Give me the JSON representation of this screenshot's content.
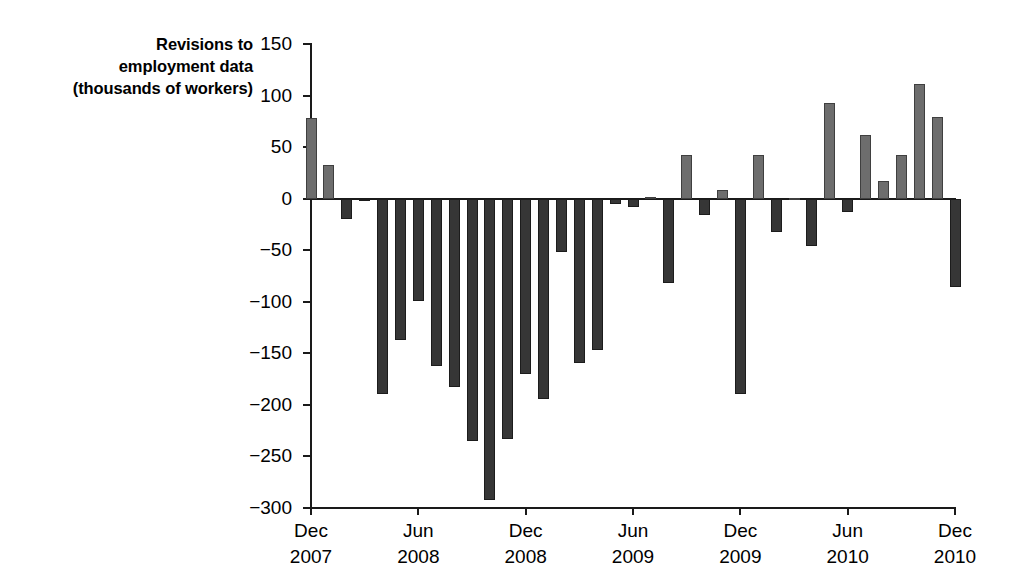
{
  "chart_data": {
    "type": "bar",
    "title": "",
    "ylabel_lines": [
      "Revisions to",
      "employment data",
      "(thousands of workers)"
    ],
    "xlabel": "",
    "ylabel": "Revisions to employment data (thousands of workers)",
    "ylim": [
      -300,
      150
    ],
    "ytick_values": [
      150,
      100,
      50,
      0,
      -50,
      -100,
      -150,
      -200,
      -250,
      -300
    ],
    "ytick_labels": [
      "150",
      "100",
      "50",
      "0",
      "−50",
      "−100",
      "−150",
      "−200",
      "−250",
      "−300"
    ],
    "grid": false,
    "legend": "none",
    "xtick_labels": [
      {
        "month": "Dec",
        "year": "2007",
        "index": 0
      },
      {
        "month": "Jun",
        "year": "2008",
        "index": 6
      },
      {
        "month": "Dec",
        "year": "2008",
        "index": 12
      },
      {
        "month": "Jun",
        "year": "2009",
        "index": 18
      },
      {
        "month": "Dec",
        "year": "2009",
        "index": 24
      },
      {
        "month": "Jun",
        "year": "2010",
        "index": 30
      },
      {
        "month": "Dec",
        "year": "2010",
        "index": 36
      }
    ],
    "categories": [
      "Dec 2007",
      "Jan 2008",
      "Feb 2008",
      "Mar 2008",
      "Apr 2008",
      "May 2008",
      "Jun 2008",
      "Jul 2008",
      "Aug 2008",
      "Sep 2008",
      "Oct 2008",
      "Nov 2008",
      "Dec 2008",
      "Jan 2009",
      "Feb 2009",
      "Mar 2009",
      "Apr 2009",
      "May 2009",
      "Jun 2009",
      "Jul 2009",
      "Aug 2009",
      "Sep 2009",
      "Oct 2009",
      "Nov 2009",
      "Dec 2009",
      "Jan 2010",
      "Feb 2010",
      "Mar 2010",
      "Apr 2010",
      "May 2010",
      "Jun 2010",
      "Jul 2010",
      "Aug 2010",
      "Sep 2010",
      "Oct 2010",
      "Nov 2010",
      "Dec 2010"
    ],
    "values": [
      78,
      33,
      -20,
      -2,
      -189,
      -137,
      -99,
      -162,
      -183,
      -235,
      -292,
      -233,
      -170,
      -194,
      -52,
      -159,
      -147,
      -5,
      -8,
      2,
      -82,
      42,
      -16,
      8,
      -189,
      42,
      -32,
      1,
      -46,
      93,
      -13,
      62,
      17,
      42,
      111,
      79,
      -86
    ],
    "positive_color": "#6d6d6d",
    "negative_color": "#363636",
    "axis_color": "#1a1a1a",
    "background_color": "#ffffff"
  }
}
